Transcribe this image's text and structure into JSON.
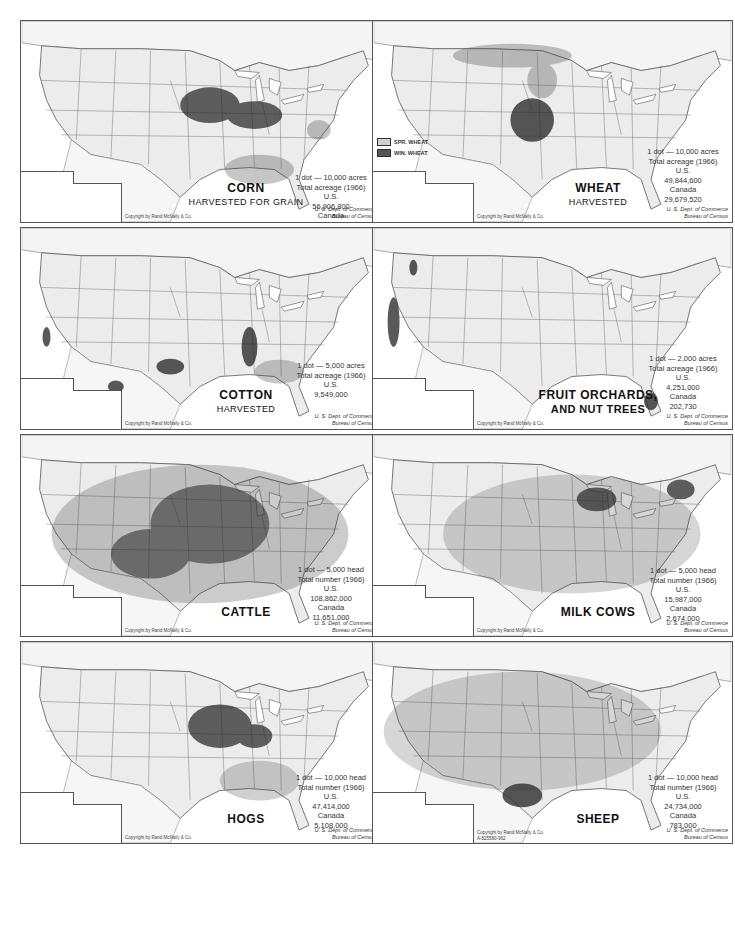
{
  "page": {
    "header_mark": "•"
  },
  "panels": [
    {
      "id": "corn",
      "title": "CORN",
      "subtitle": "HARVESTED FOR GRAIN",
      "legend": {
        "dot_value": "1 dot — 10,000 acres",
        "total_label": "Total acreage (1966)",
        "us_label": "U.S.",
        "us_value": "56,906,800",
        "canada_label": "Canada",
        "canada_value": "805,220"
      },
      "copyright": "Copyright by Rand McNally & Co.",
      "source_line1": "U. S. Dept. of Commerce",
      "source_line2": "Bureau of Census"
    },
    {
      "id": "wheat",
      "title": "WHEAT",
      "subtitle": "HARVESTED",
      "key": [
        {
          "label": "SPR. WHEAT",
          "swatch": "light"
        },
        {
          "label": "WIN. WHEAT",
          "swatch": "dark"
        }
      ],
      "legend": {
        "dot_value": "1 dot — 10,000 acres",
        "total_label": "Total acreage (1966)",
        "us_label": "U.S.",
        "us_value": "49,844,600",
        "canada_label": "Canada",
        "canada_value": "29,679,520"
      },
      "copyright": "Copyright by Rand McNally & Co.",
      "source_line1": "U. S. Dept. of Commerce",
      "source_line2": "Bureau of Census"
    },
    {
      "id": "cotton",
      "title": "COTTON",
      "subtitle": "HARVESTED",
      "legend": {
        "dot_value": "1 dot — 5,000 acres",
        "total_label": "Total acreage (1966)",
        "us_label": "U.S.",
        "us_value": "9,549,000"
      },
      "copyright": "Copyright by Rand McNally & Co.",
      "source_line1": "U. S. Dept. of Commerce",
      "source_line2": "Bureau of Census"
    },
    {
      "id": "fruit",
      "title": "FRUIT ORCHARDS,",
      "subtitle": "AND NUT TREES",
      "legend": {
        "dot_value": "1 dot — 2,000 acres",
        "total_label": "Total acreage (1966)",
        "us_label": "U.S.",
        "us_value": "4,251,000",
        "canada_label": "Canada",
        "canada_value": "202,730"
      },
      "copyright": "Copyright by Rand McNally & Co.",
      "source_line1": "U. S. Dept. of Commerce",
      "source_line2": "Bureau of Census"
    },
    {
      "id": "cattle",
      "title": "CATTLE",
      "subtitle": "",
      "legend": {
        "dot_value": "1 dot — 5,000 head",
        "total_label": "Total number (1966)",
        "us_label": "U.S.",
        "us_value": "108,862,000",
        "canada_label": "Canada",
        "canada_value": "11,651,000"
      },
      "copyright": "Copyright by Rand McNally & Co.",
      "source_line1": "U. S. Dept. of Commerce",
      "source_line2": "Bureau of Census"
    },
    {
      "id": "milk-cows",
      "title": "MILK COWS",
      "subtitle": "",
      "legend": {
        "dot_value": "1 dot — 5,000 head",
        "total_label": "Total number (1966)",
        "us_label": "U.S.",
        "us_value": "15,987,000",
        "canada_label": "Canada",
        "canada_value": "2,674,000"
      },
      "copyright": "Copyright by Rand McNally & Co.",
      "source_line1": "U. S. Dept. of Commerce",
      "source_line2": "Bureau of Census"
    },
    {
      "id": "hogs",
      "title": "HOGS",
      "subtitle": "",
      "legend": {
        "dot_value": "1 dot — 10,000 head",
        "total_label": "Total number (1966)",
        "us_label": "U.S.",
        "us_value": "47,414,000",
        "canada_label": "Canada",
        "canada_value": "5,108,000"
      },
      "copyright": "Copyright by Rand McNally & Co.",
      "source_line1": "U. S. Dept. of Commerce",
      "source_line2": "Bureau of Census"
    },
    {
      "id": "sheep",
      "title": "SHEEP",
      "subtitle": "",
      "legend": {
        "dot_value": "1 dot — 10,000 head",
        "total_label": "Total number (1966)",
        "us_label": "U.S.",
        "us_value": "24,734,000",
        "canada_label": "Canada",
        "canada_value": "783,000"
      },
      "copyright": "Copyright by Rand McNally & Co.",
      "copyright_line2": "A-525580-962",
      "source_line1": "U. S. Dept. of Commerce",
      "source_line2": "Bureau of Census"
    }
  ],
  "colors": {
    "land": "#ededed",
    "water": "#ffffff",
    "border": "#555555",
    "dots": "#222222"
  }
}
